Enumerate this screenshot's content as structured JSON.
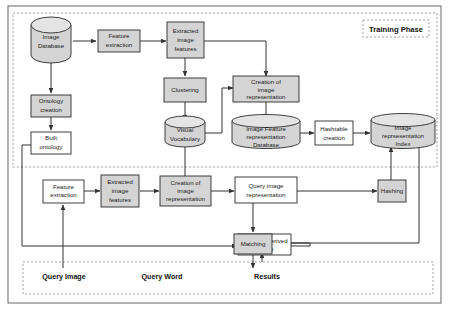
{
  "diagram": {
    "colors": {
      "node_fill_gray": "#d4d4d4",
      "node_fill_white": "#ffffff",
      "node_stroke": "#2b2b2b",
      "edge": "#333333",
      "dashed_boundary": "#9a9a9a",
      "text": "#1a1a1a"
    },
    "phases": {
      "training_label": "Training Phase"
    },
    "nodes": {
      "image_database": "Image\nDatabase",
      "feature_extraction_top": "Feature\nextraction",
      "extracted_image_features_top": "Extracted\nimage\nfeatures",
      "ontology_creation": "Ontology\ncreation",
      "built_ontology": "Built\nontology",
      "clustering": "Clustering",
      "visual_vocabulary": "Visual\nVocabulary",
      "creation_of_image_representation_top": "Creation of\nimage\nrepresentation",
      "image_feature_representation_database": "Image Feature\nrepresentation\nDatabase",
      "hashtable_creation": "Hashtable\ncreation",
      "image_representation_index": "Image\nreprsesentation\nIndex",
      "feature_extraction_bottom": "Feature\nextraction",
      "extracted_image_features_bottom": "Extracted\nimage\nfeatures",
      "creation_of_image_representation_bottom": "Creation of\nimage\nrepresentation",
      "query_image_representation": "Query image\nrepresentation",
      "hashing": "Hashing",
      "ontology_derived_results": "Ontology derived\nresults",
      "matching": "Matching"
    },
    "io_labels": {
      "query_image": "Query Image",
      "query_word": "Query Word",
      "results": "Results"
    }
  }
}
